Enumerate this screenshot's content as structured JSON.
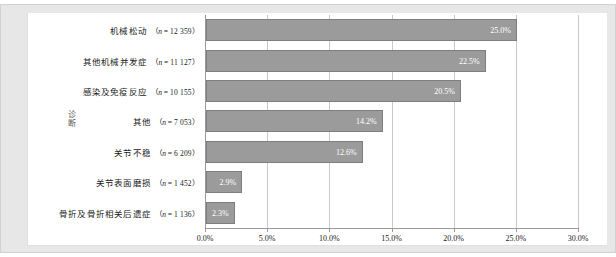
{
  "figure": {
    "y_axis_title": "诊断"
  },
  "chart_data": {
    "type": "bar",
    "orientation": "horizontal",
    "title": "",
    "xlabel": "",
    "ylabel": "诊断",
    "xlim": [
      0,
      30
    ],
    "xticks": [
      "0.0%",
      "5.0%",
      "10.0%",
      "15.0%",
      "20.0%",
      "25.0%",
      "30.0%"
    ],
    "xtick_values": [
      0,
      5,
      10,
      15,
      20,
      25,
      30
    ],
    "grid": true,
    "legend": "none",
    "bar_color": "#9b9b9b",
    "bar_border_color": "#7e7e7e",
    "categories": [
      "机械松动",
      "其他机械并发症",
      "感染及免疫反应",
      "其他",
      "关节不稳",
      "关节表面磨损",
      "骨折及骨折相关后遗症"
    ],
    "counts": [
      "12 359",
      "11 127",
      "10 155",
      "7 053",
      "6 209",
      "1 452",
      "1 136"
    ],
    "count_prefix": "n",
    "values": [
      25.0,
      22.5,
      20.5,
      14.2,
      12.6,
      2.9,
      2.3
    ],
    "value_labels": [
      "25.0%",
      "22.5%",
      "20.5%",
      "14.2%",
      "12.6%",
      "2.9%",
      "2.3%"
    ]
  }
}
